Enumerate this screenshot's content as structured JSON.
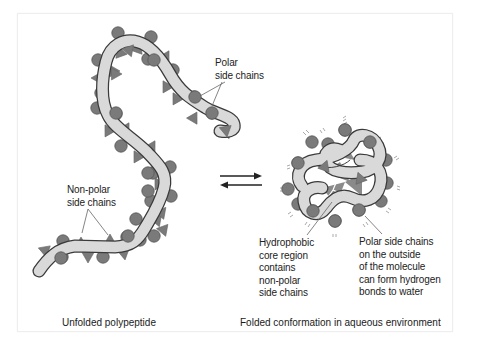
{
  "figure": {
    "left_panel": {
      "caption": "Unfolded polypeptide",
      "labels": {
        "polar": "Polar\nside chains",
        "nonpolar": "Non-polar\nside chains"
      }
    },
    "right_panel": {
      "caption": "Folded conformation in aqueous environment",
      "labels": {
        "core": "Hydrophobic\ncore region\ncontains\nnon-polar\nside chains",
        "polar_outside": "Polar side chains\non the outside\nof the molecule\ncan form hydrogen\nbonds to water"
      }
    },
    "equilibrium_arrows": "reversible",
    "colors": {
      "backbone_fill": "#d9d9d9",
      "outline": "#3a3a3a",
      "side_chain": "#7a7a7a",
      "text": "#222222",
      "frame_border": "#eeeeee"
    }
  }
}
